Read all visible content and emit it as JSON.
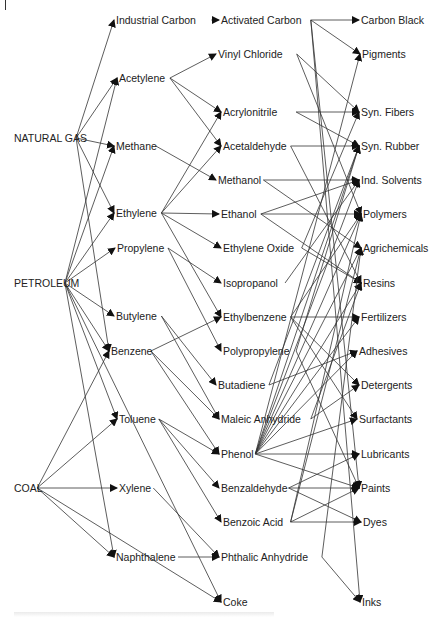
{
  "diagram": {
    "nodes": [
      {
        "id": "natural_gas",
        "label": "NATURAL GAS",
        "col": 0
      },
      {
        "id": "petroleum",
        "label": "PETROLEUM",
        "col": 0
      },
      {
        "id": "coal",
        "label": "COAL",
        "col": 0
      },
      {
        "id": "industrial_carbon",
        "label": "Industrial Carbon",
        "col": 1
      },
      {
        "id": "acetylene",
        "label": "Acetylene",
        "col": 1
      },
      {
        "id": "methane",
        "label": "Methane",
        "col": 1
      },
      {
        "id": "ethylene",
        "label": "Ethylene",
        "col": 1
      },
      {
        "id": "propylene",
        "label": "Propylene",
        "col": 1
      },
      {
        "id": "butylene",
        "label": "Butylene",
        "col": 1
      },
      {
        "id": "benzene",
        "label": "Benzene",
        "col": 1
      },
      {
        "id": "toluene",
        "label": "Toluene",
        "col": 1
      },
      {
        "id": "xylene",
        "label": "Xylene",
        "col": 1
      },
      {
        "id": "naphthalene",
        "label": "Naphthalene",
        "col": 1
      },
      {
        "id": "activated_carbon",
        "label": "Activated Carbon",
        "col": 2
      },
      {
        "id": "vinyl_chloride",
        "label": "Vinyl Chloride",
        "col": 2
      },
      {
        "id": "acrylonitrile",
        "label": "Acrylonitrile",
        "col": 2
      },
      {
        "id": "acetaldehyde",
        "label": "Acetaldehyde",
        "col": 2
      },
      {
        "id": "methanol",
        "label": "Methanol",
        "col": 2
      },
      {
        "id": "ethanol",
        "label": "Ethanol",
        "col": 2
      },
      {
        "id": "ethylene_oxide",
        "label": "Ethylene Oxide",
        "col": 2
      },
      {
        "id": "isopropanol",
        "label": "Isopropanol",
        "col": 2
      },
      {
        "id": "ethylbenzene",
        "label": "Ethylbenzene",
        "col": 2
      },
      {
        "id": "polypropylene",
        "label": "Polypropylene",
        "col": 2
      },
      {
        "id": "butadiene",
        "label": "Butadiene",
        "col": 2
      },
      {
        "id": "maleic_anhydride",
        "label": "Maleic Anhydride",
        "col": 2
      },
      {
        "id": "phenol",
        "label": "Phenol",
        "col": 2
      },
      {
        "id": "benzaldehyde",
        "label": "Benzaldehyde",
        "col": 2
      },
      {
        "id": "benzoic_acid",
        "label": "Benzoic Acid",
        "col": 2
      },
      {
        "id": "phthalic_anhydride",
        "label": "Phthalic Anhydride",
        "col": 2
      },
      {
        "id": "coke",
        "label": "Coke",
        "col": 2
      },
      {
        "id": "carbon_black",
        "label": "Carbon Black",
        "col": 3
      },
      {
        "id": "pigments",
        "label": "Pigments",
        "col": 3
      },
      {
        "id": "syn_fibers",
        "label": "Syn. Fibers",
        "col": 3
      },
      {
        "id": "syn_rubber",
        "label": "Syn. Rubber",
        "col": 3
      },
      {
        "id": "ind_solvents",
        "label": "Ind. Solvents",
        "col": 3
      },
      {
        "id": "polymers",
        "label": "Polymers",
        "col": 3
      },
      {
        "id": "agrichemicals",
        "label": "Agrichemicals",
        "col": 3
      },
      {
        "id": "resins",
        "label": "Resins",
        "col": 3
      },
      {
        "id": "fertilizers",
        "label": "Fertilizers",
        "col": 3
      },
      {
        "id": "adhesives",
        "label": "Adhesives",
        "col": 3
      },
      {
        "id": "detergents",
        "label": "Detergents",
        "col": 3
      },
      {
        "id": "surfactants",
        "label": "Surfactants",
        "col": 3
      },
      {
        "id": "lubricants",
        "label": "Lubricants",
        "col": 3
      },
      {
        "id": "paints",
        "label": "Paints",
        "col": 3
      },
      {
        "id": "dyes",
        "label": "Dyes",
        "col": 3
      },
      {
        "id": "inks",
        "label": "Inks",
        "col": 3
      }
    ],
    "edges": [
      [
        "natural_gas",
        "industrial_carbon"
      ],
      [
        "natural_gas",
        "acetylene"
      ],
      [
        "natural_gas",
        "methane"
      ],
      [
        "natural_gas",
        "ethylene"
      ],
      [
        "natural_gas",
        "benzene"
      ],
      [
        "petroleum",
        "acetylene"
      ],
      [
        "petroleum",
        "methane"
      ],
      [
        "petroleum",
        "ethylene"
      ],
      [
        "petroleum",
        "propylene"
      ],
      [
        "petroleum",
        "butylene"
      ],
      [
        "petroleum",
        "benzene"
      ],
      [
        "petroleum",
        "toluene"
      ],
      [
        "petroleum",
        "naphthalene"
      ],
      [
        "petroleum",
        "coke"
      ],
      [
        "coal",
        "benzene"
      ],
      [
        "coal",
        "toluene"
      ],
      [
        "coal",
        "xylene"
      ],
      [
        "coal",
        "naphthalene"
      ],
      [
        "coal",
        "coke"
      ],
      [
        "industrial_carbon",
        "activated_carbon"
      ],
      [
        "acetylene",
        "vinyl_chloride"
      ],
      [
        "acetylene",
        "acrylonitrile"
      ],
      [
        "acetylene",
        "acetaldehyde"
      ],
      [
        "methane",
        "methanol"
      ],
      [
        "ethylene",
        "acrylonitrile"
      ],
      [
        "ethylene",
        "acetaldehyde"
      ],
      [
        "ethylene",
        "ethanol"
      ],
      [
        "ethylene",
        "ethylene_oxide"
      ],
      [
        "ethylene",
        "ethylbenzene"
      ],
      [
        "propylene",
        "isopropanol"
      ],
      [
        "propylene",
        "polypropylene"
      ],
      [
        "butylene",
        "butadiene"
      ],
      [
        "butylene",
        "maleic_anhydride"
      ],
      [
        "benzene",
        "ethylbenzene"
      ],
      [
        "benzene",
        "maleic_anhydride"
      ],
      [
        "benzene",
        "phenol"
      ],
      [
        "toluene",
        "phenol"
      ],
      [
        "toluene",
        "benzaldehyde"
      ],
      [
        "toluene",
        "benzoic_acid"
      ],
      [
        "xylene",
        "phthalic_anhydride"
      ],
      [
        "naphthalene",
        "phthalic_anhydride"
      ],
      [
        "activated_carbon",
        "carbon_black"
      ],
      [
        "activated_carbon",
        "pigments"
      ],
      [
        "activated_carbon",
        "paints"
      ],
      [
        "activated_carbon",
        "inks"
      ],
      [
        "vinyl_chloride",
        "syn_fibers"
      ],
      [
        "vinyl_chloride",
        "polymers"
      ],
      [
        "acrylonitrile",
        "syn_fibers"
      ],
      [
        "acrylonitrile",
        "syn_rubber"
      ],
      [
        "acetaldehyde",
        "syn_rubber"
      ],
      [
        "acetaldehyde",
        "resins"
      ],
      [
        "methanol",
        "ind_solvents"
      ],
      [
        "methanol",
        "agrichemicals"
      ],
      [
        "ethanol",
        "ind_solvents"
      ],
      [
        "ethanol",
        "polymers"
      ],
      [
        "ethanol",
        "resins"
      ],
      [
        "ethylene_oxide",
        "syn_fibers"
      ],
      [
        "ethylene_oxide",
        "resins"
      ],
      [
        "isopropanol",
        "ind_solvents"
      ],
      [
        "ethylbenzene",
        "fertilizers"
      ],
      [
        "ethylbenzene",
        "detergents"
      ],
      [
        "ethylbenzene",
        "surfactants"
      ],
      [
        "ethylbenzene",
        "polymers"
      ],
      [
        "polypropylene",
        "syn_rubber"
      ],
      [
        "polypropylene",
        "paints"
      ],
      [
        "butadiene",
        "syn_rubber"
      ],
      [
        "butadiene",
        "adhesives"
      ],
      [
        "maleic_anhydride",
        "resins"
      ],
      [
        "maleic_anhydride",
        "detergents"
      ],
      [
        "phenol",
        "pigments"
      ],
      [
        "phenol",
        "syn_rubber"
      ],
      [
        "phenol",
        "ind_solvents"
      ],
      [
        "phenol",
        "polymers"
      ],
      [
        "phenol",
        "agrichemicals"
      ],
      [
        "phenol",
        "resins"
      ],
      [
        "phenol",
        "fertilizers"
      ],
      [
        "phenol",
        "adhesives"
      ],
      [
        "phenol",
        "surfactants"
      ],
      [
        "phenol",
        "lubricants"
      ],
      [
        "phenol",
        "paints"
      ],
      [
        "benzaldehyde",
        "lubricants"
      ],
      [
        "benzaldehyde",
        "dyes"
      ],
      [
        "benzaldehyde",
        "paints"
      ],
      [
        "benzoic_acid",
        "polymers"
      ],
      [
        "benzoic_acid",
        "agrichemicals"
      ],
      [
        "benzoic_acid",
        "paints"
      ],
      [
        "benzoic_acid",
        "dyes"
      ],
      [
        "phthalic_anhydride",
        "agrichemicals"
      ],
      [
        "phthalic_anhydride",
        "inks"
      ]
    ]
  }
}
